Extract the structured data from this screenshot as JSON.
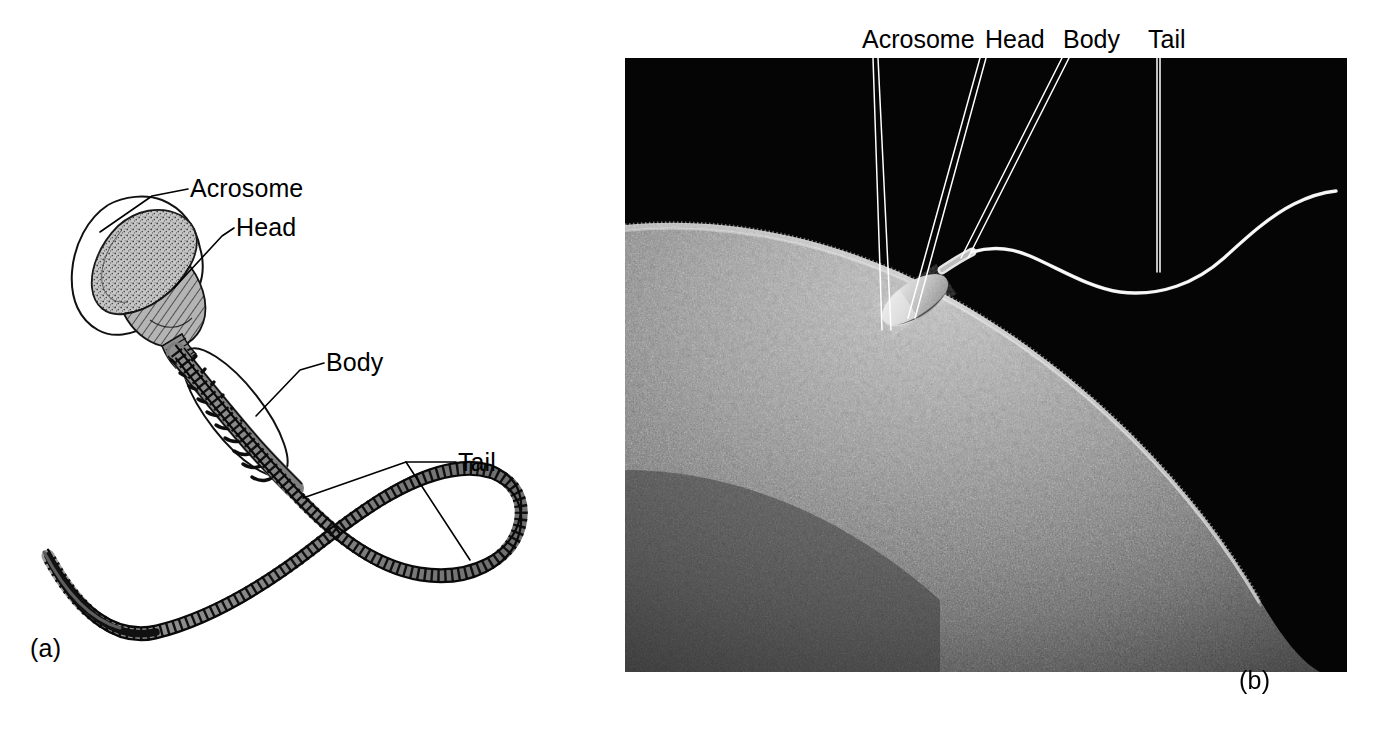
{
  "figure": {
    "type": "two-panel scientific figure",
    "panels": [
      {
        "id": "a",
        "caption": "(a)",
        "kind": "line drawing",
        "labels": [
          "Acrosome",
          "Head",
          "Body",
          "Tail"
        ]
      },
      {
        "id": "b",
        "caption": "(b)",
        "kind": "scanning electron micrograph",
        "labels": [
          "Acrosome",
          "Head",
          "Body",
          "Tail"
        ]
      }
    ]
  },
  "panel_a": {
    "caption": "(a)",
    "labels": {
      "acrosome": "Acrosome",
      "head": "Head",
      "body": "Body",
      "tail": "Tail"
    }
  },
  "panel_b": {
    "caption": "(b)",
    "labels": {
      "acrosome": "Acrosome",
      "head": "Head",
      "body": "Body",
      "tail": "Tail"
    }
  },
  "colors": {
    "background": "#ffffff",
    "ink": "#000000",
    "micrograph_background": "#050505",
    "egg_surface": "#8c8c8c",
    "sperm_highlight": "#e8e8e8",
    "acrosome_fill": "#c9c9c9",
    "nucleus_fill": "#a8a8a8",
    "midpiece_fill": "#8f8f8f",
    "leader_light": "#ffffff"
  }
}
